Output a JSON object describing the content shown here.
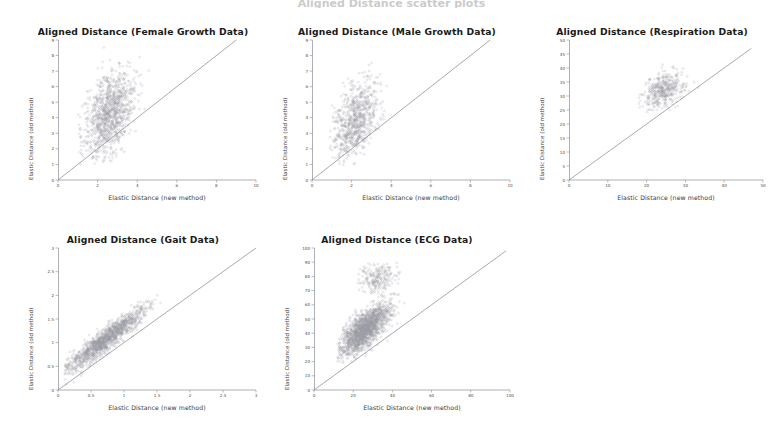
{
  "figure": {
    "background": "#ffffff",
    "point_color": "#9a9aa4",
    "line_color": "#7a7a86",
    "axis_color": "#8c8c9a",
    "cropped_header_text": "Aligned Distance scatter plots"
  },
  "common": {
    "xlabel": "Elastic Distance (new method)",
    "ylabel": "Elastic Distance (old method)"
  },
  "chart_data": [
    {
      "type": "scatter",
      "id": "female-growth",
      "title": "Aligned Distance (Female Growth Data)",
      "xlabel": "Elastic Distance (new method)",
      "ylabel": "Elastic Distance (old method)",
      "xlim": [
        0,
        10
      ],
      "ylim": [
        0,
        9
      ],
      "xticks": [
        0,
        2,
        4,
        6,
        8,
        10
      ],
      "yticks": [
        0,
        1,
        2,
        3,
        4,
        5,
        6,
        7,
        8,
        9
      ],
      "grid": false,
      "legend": null,
      "reference_line": {
        "type": "identity",
        "from": [
          0,
          0
        ],
        "to": [
          9,
          9
        ],
        "label": "y = x"
      },
      "cloud": {
        "n": 1100,
        "x_center": 2.6,
        "y_center": 4.3,
        "x_spread": 0.62,
        "y_spread": 1.35,
        "correlation": 0.45,
        "x_range": [
          1.0,
          5.2
        ],
        "y_range": [
          1.0,
          8.6
        ]
      },
      "annotations": []
    },
    {
      "type": "scatter",
      "id": "male-growth",
      "title": "Aligned Distance (Male Growth Data)",
      "xlabel": "Elastic Distance (new method)",
      "ylabel": "Elastic Distance (old method)",
      "xlim": [
        0,
        10
      ],
      "ylim": [
        0,
        9
      ],
      "xticks": [
        0,
        2,
        4,
        6,
        8,
        10
      ],
      "yticks": [
        0,
        1,
        2,
        3,
        4,
        5,
        6,
        7,
        8,
        9
      ],
      "grid": false,
      "legend": null,
      "reference_line": {
        "type": "identity",
        "from": [
          0,
          0
        ],
        "to": [
          9,
          9
        ],
        "label": "y = x"
      },
      "cloud": {
        "n": 800,
        "x_center": 2.2,
        "y_center": 3.8,
        "x_spread": 0.55,
        "y_spread": 1.25,
        "correlation": 0.42,
        "x_range": [
          0.9,
          4.6
        ],
        "y_range": [
          0.9,
          8.4
        ]
      },
      "annotations": []
    },
    {
      "type": "scatter",
      "id": "respiration",
      "title": "Aligned Distance (Respiration Data)",
      "xlabel": "Elastic Distance (new method)",
      "ylabel": "Elastic Distance (old method)",
      "xlim": [
        0,
        50
      ],
      "ylim": [
        0,
        50
      ],
      "xticks": [
        0,
        10,
        20,
        30,
        40,
        50
      ],
      "yticks": [
        0,
        5,
        10,
        15,
        20,
        25,
        30,
        35,
        40,
        45,
        50
      ],
      "grid": false,
      "legend": null,
      "reference_line": {
        "type": "identity",
        "from": [
          0,
          0
        ],
        "to": [
          47,
          47
        ],
        "label": "y = x"
      },
      "cloud": {
        "n": 420,
        "x_center": 24.5,
        "y_center": 32.0,
        "x_spread": 2.6,
        "y_spread": 3.0,
        "correlation": 0.3,
        "x_range": [
          17,
          34
        ],
        "y_range": [
          24,
          45
        ]
      },
      "annotations": []
    },
    {
      "type": "scatter",
      "id": "gait",
      "title": "Aligned Distance (Gait Data)",
      "xlabel": "Elastic Distance (new method)",
      "ylabel": "Elastic Distance (old method)",
      "xlim": [
        0,
        3
      ],
      "ylim": [
        0,
        3
      ],
      "xticks": [
        0,
        0.5,
        1,
        1.5,
        2,
        2.5,
        3
      ],
      "yticks": [
        0,
        0.5,
        1,
        1.5,
        2,
        2.5,
        3
      ],
      "grid": false,
      "legend": null,
      "reference_line": {
        "type": "identity",
        "from": [
          0,
          0
        ],
        "to": [
          3,
          3
        ],
        "label": "y = x"
      },
      "cloud": {
        "n": 1400,
        "x_center": 0.72,
        "y_center": 1.06,
        "x_spread": 0.3,
        "y_spread": 0.34,
        "correlation": 0.93,
        "x_range": [
          0.1,
          1.75
        ],
        "y_range": [
          0.12,
          2.05
        ]
      },
      "annotations": []
    },
    {
      "type": "scatter",
      "id": "ecg",
      "title": "Aligned Distance (ECG Data)",
      "xlabel": "Elastic Distance (new method)",
      "ylabel": "Elastic Distance (old method)",
      "xlim": [
        0,
        100
      ],
      "ylim": [
        0,
        100
      ],
      "xticks": [
        0,
        20,
        40,
        60,
        80,
        100
      ],
      "yticks": [
        0,
        10,
        20,
        30,
        40,
        50,
        60,
        70,
        80,
        90,
        100
      ],
      "grid": false,
      "legend": null,
      "reference_line": {
        "type": "identity",
        "from": [
          0,
          0
        ],
        "to": [
          98,
          98
        ],
        "label": "y = x"
      },
      "cloud": {
        "n": 1700,
        "x_center": 26.0,
        "y_center": 43.0,
        "x_spread": 6.5,
        "y_spread": 9.0,
        "correlation": 0.72,
        "x_range": [
          12,
          50
        ],
        "y_range": [
          18,
          68
        ]
      },
      "secondary_cloud": {
        "n": 230,
        "x_center": 33.0,
        "y_center": 79.0,
        "x_spread": 5.0,
        "y_spread": 5.5,
        "correlation": 0.15,
        "x_range": [
          22,
          48
        ],
        "y_range": [
          66,
          90
        ]
      },
      "annotations": []
    }
  ]
}
